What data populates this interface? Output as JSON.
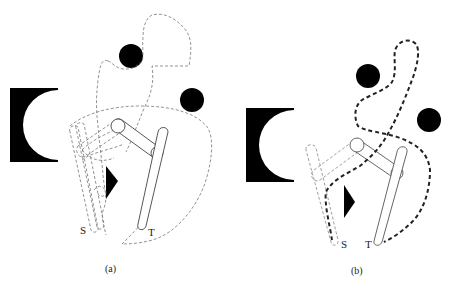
{
  "figure": {
    "panels": [
      {
        "id": "a",
        "caption": "(a)",
        "start_label": "S",
        "target_label": "T",
        "path_style": "thin dashed swept-region boundaries"
      },
      {
        "id": "b",
        "caption": "(b)",
        "start_label": "S",
        "target_label": "T",
        "path_style": "thick dashed collision-free path"
      }
    ],
    "elements": {
      "obstacles": [
        "c-shaped-block",
        "circle-obstacle-upper",
        "circle-obstacle-right",
        "triangle-obstacle"
      ],
      "robot": "two-link planar arm",
      "colors": {
        "obstacle": "#000000",
        "outline": "#555555",
        "dashed": "#666666",
        "path": "#222222",
        "background": "#ffffff"
      }
    }
  }
}
